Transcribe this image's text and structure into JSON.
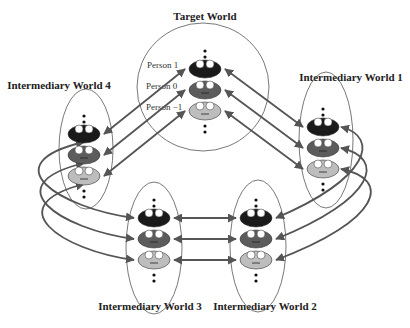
{
  "diagram": {
    "worlds": [
      {
        "id": "target",
        "title": "Target World",
        "person_labels": [
          "Person 1",
          "Person 0",
          "Person −1"
        ]
      },
      {
        "id": "w1",
        "title": "Intermediary World 1"
      },
      {
        "id": "w2",
        "title": "Intermediary World 2"
      },
      {
        "id": "w3",
        "title": "Intermediary World 3"
      },
      {
        "id": "w4",
        "title": "Intermediary World 4"
      }
    ],
    "persons": [
      {
        "name": "Person 1",
        "color": "#1a1a1a"
      },
      {
        "name": "Person 0",
        "color": "#5c5c5c"
      },
      {
        "name": "Person -1",
        "color": "#bdbdbd"
      }
    ],
    "arrow_color": "#555555",
    "connections": [
      {
        "from": "target",
        "to": "w1"
      },
      {
        "from": "w1",
        "to": "w2"
      },
      {
        "from": "w2",
        "to": "w3"
      },
      {
        "from": "w3",
        "to": "w4"
      },
      {
        "from": "w4",
        "to": "target"
      }
    ]
  }
}
